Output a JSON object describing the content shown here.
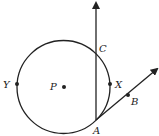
{
  "diagram": {
    "type": "geometry",
    "stroke_color": "#222222",
    "circle": {
      "center_label": "P",
      "cx": 63.5,
      "cy": 87,
      "r": 46.5
    },
    "points": [
      {
        "id": "P",
        "label": "P",
        "x": 64,
        "y": 87,
        "label_x": 50,
        "label_y": 90
      },
      {
        "id": "Y",
        "label": "Y",
        "x": 17,
        "y": 84,
        "label_x": 3,
        "label_y": 88
      },
      {
        "id": "X",
        "label": "X",
        "x": 110,
        "y": 84,
        "label_x": 115,
        "label_y": 88
      },
      {
        "id": "C",
        "label": "C",
        "x": 96,
        "y": 51,
        "label_x": 99,
        "label_y": 52
      },
      {
        "id": "A",
        "label": "A",
        "x": 96,
        "y": 120,
        "label_x": 93,
        "label_y": 134
      },
      {
        "id": "B",
        "label": "B",
        "x": 128,
        "y": 95,
        "label_x": 131,
        "label_y": 105
      }
    ],
    "rays": [
      {
        "name": "ray-AC",
        "from": "A",
        "x1": 96,
        "y1": 120,
        "x2": 96,
        "y2": 3
      },
      {
        "name": "ray-AB",
        "from": "A",
        "x1": 96,
        "y1": 120,
        "x2": 157,
        "y2": 69
      }
    ]
  }
}
